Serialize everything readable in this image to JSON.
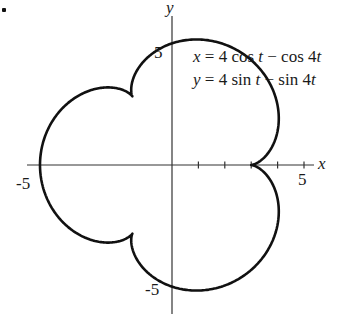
{
  "chart_data": {
    "type": "line",
    "subtype": "parametric",
    "title": "",
    "equations": {
      "x": "x = 4 cos t − cos 4t",
      "y": "y = 4 sin t − sin 4t"
    },
    "parametric": {
      "a": 4,
      "b": 1,
      "k": 4,
      "t_range": [
        0,
        6.283185307
      ]
    },
    "xlabel": "x",
    "ylabel": "y",
    "xlim": [
      -5.5,
      5.5
    ],
    "ylim": [
      -5.5,
      5.5
    ],
    "x_ticks": [
      1,
      2,
      3,
      4,
      5
    ],
    "x_tick_labels": {
      "-5": "-5",
      "5": "5"
    },
    "y_tick_labels": {
      "5": "5",
      "-5": "-5"
    },
    "grid": false,
    "legend": null,
    "annotations": [
      "x = 4 cos t − cos 4t",
      "y = 4 sin t − sin 4t"
    ],
    "key_points": [
      {
        "x": 3,
        "y": 0,
        "note": "cusp"
      },
      {
        "x": -5,
        "y": 0
      },
      {
        "x": 0,
        "y": 5
      },
      {
        "x": 0,
        "y": -5
      }
    ],
    "colors": {
      "curve": "#111111",
      "axes": "#333333"
    }
  },
  "labels": {
    "x_axis": "x",
    "y_axis": "y",
    "x_pos5": "5",
    "x_neg5": "-5",
    "y_pos5": "5",
    "y_neg5": "-5",
    "eq_x_lhs": "x",
    "eq_x_rhs": " = 4 cos ",
    "eq_x_t1": "t",
    "eq_x_mid": " − cos 4",
    "eq_x_t2": "t",
    "eq_y_lhs": "y",
    "eq_y_rhs": " = 4 sin ",
    "eq_y_t1": "t",
    "eq_y_mid": " − sin 4",
    "eq_y_t2": "t"
  }
}
